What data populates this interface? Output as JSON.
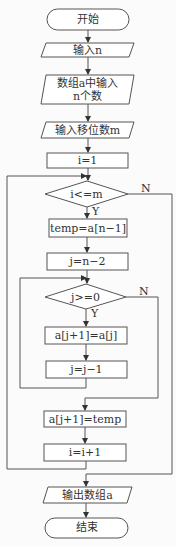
{
  "flowchart": {
    "nodes": [
      {
        "id": "start",
        "type": "terminator",
        "label": "开始"
      },
      {
        "id": "input_n",
        "type": "io",
        "label": "输入n"
      },
      {
        "id": "input_array",
        "type": "io",
        "label_line1": "数组a中输入",
        "label_line2": "n个数"
      },
      {
        "id": "input_m",
        "type": "io",
        "label": "输入移位数m"
      },
      {
        "id": "init_i",
        "type": "process",
        "label": "i=1"
      },
      {
        "id": "cond_i",
        "type": "decision",
        "label": "i<=m"
      },
      {
        "id": "temp",
        "type": "process",
        "label": "temp=a[n−1]"
      },
      {
        "id": "init_j",
        "type": "process",
        "label": "j=n−2"
      },
      {
        "id": "cond_j",
        "type": "decision",
        "label": "j>=0"
      },
      {
        "id": "shift",
        "type": "process",
        "label": "a[j+1]=a[j]"
      },
      {
        "id": "dec_j",
        "type": "process",
        "label": "j=j−1"
      },
      {
        "id": "place",
        "type": "process",
        "label": "a[j+1]=temp"
      },
      {
        "id": "inc_i",
        "type": "process",
        "label": "i=i+1"
      },
      {
        "id": "output",
        "type": "io",
        "label": "输出数组a"
      },
      {
        "id": "end",
        "type": "terminator",
        "label": "结束"
      }
    ],
    "branch_labels": {
      "cond_i_yes": "Y",
      "cond_i_no": "N",
      "cond_j_yes": "Y",
      "cond_j_no": "N"
    }
  }
}
